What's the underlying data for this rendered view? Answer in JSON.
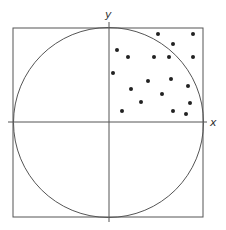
{
  "diagram": {
    "colors": {
      "stroke": "#555555",
      "dot": "#222222",
      "background": "#ffffff"
    },
    "axes": {
      "x_label": "x",
      "y_label": "y"
    },
    "square": {
      "x": 13,
      "y": 28,
      "width": 190,
      "height": 189
    },
    "circle": {
      "cx": 108.5,
      "cy": 122.5,
      "r": 95
    },
    "x_axis": {
      "x1": 8,
      "x2": 207,
      "y": 122
    },
    "y_axis": {
      "x": 109,
      "y1": 22,
      "y2": 222
    },
    "points": [
      [
        158,
        34
      ],
      [
        193,
        34
      ],
      [
        117,
        50
      ],
      [
        173,
        44
      ],
      [
        128,
        57
      ],
      [
        154,
        57
      ],
      [
        169,
        57
      ],
      [
        193,
        57
      ],
      [
        113,
        73
      ],
      [
        148,
        81
      ],
      [
        171,
        79
      ],
      [
        188,
        86
      ],
      [
        131,
        89
      ],
      [
        162,
        94
      ],
      [
        141,
        102
      ],
      [
        190,
        103
      ],
      [
        122,
        111
      ],
      [
        173,
        111
      ],
      [
        186,
        114
      ]
    ]
  }
}
